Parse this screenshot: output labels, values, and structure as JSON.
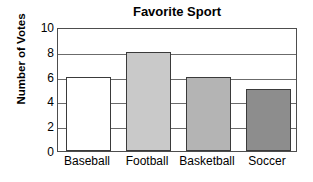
{
  "chart_data": {
    "type": "bar",
    "title": "Favorite Sport",
    "xlabel": "",
    "ylabel": "Number of Votes",
    "categories": [
      "Baseball",
      "Football",
      "Basketball",
      "Soccer"
    ],
    "values": [
      6,
      8,
      6,
      5
    ],
    "ylim": [
      0,
      10
    ],
    "yticks": [
      0,
      2,
      4,
      6,
      8,
      10
    ],
    "ytick_labels": [
      "0",
      "2",
      "4",
      "6",
      "8",
      "10"
    ],
    "grid": true,
    "grid_axis": "y",
    "legend": false,
    "bar_colors": [
      "#ffffff",
      "#c9c9c9",
      "#b4b4b4",
      "#8d8d8d"
    ],
    "bar_edge_color": "#3a3a3a",
    "axis_color": "#4d4d4d",
    "grid_color": "#6b6b6b",
    "background_color": "#ffffff",
    "text_color": "#000000"
  }
}
